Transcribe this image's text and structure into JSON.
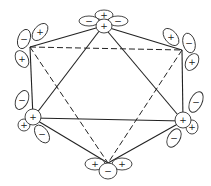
{
  "diagram": {
    "title": "",
    "vertices": [
      {
        "id": "top",
        "x": 103,
        "y": 26
      },
      {
        "id": "upper-left",
        "x": 30,
        "y": 47
      },
      {
        "id": "upper-right",
        "x": 182,
        "y": 50
      },
      {
        "id": "lower-left",
        "x": 33,
        "y": 118
      },
      {
        "id": "lower-right",
        "x": 183,
        "y": 121
      },
      {
        "id": "bottom",
        "x": 108,
        "y": 163
      }
    ],
    "solid_edges": [
      [
        "top",
        "upper-left"
      ],
      [
        "top",
        "upper-right"
      ],
      [
        "top",
        "lower-left"
      ],
      [
        "top",
        "lower-right"
      ],
      [
        "upper-left",
        "lower-left"
      ],
      [
        "upper-right",
        "lower-right"
      ],
      [
        "lower-left",
        "lower-right"
      ],
      [
        "lower-left",
        "bottom"
      ],
      [
        "lower-right",
        "bottom"
      ]
    ],
    "dashed_edges": [
      [
        "upper-left",
        "upper-right"
      ],
      [
        "upper-left",
        "bottom"
      ],
      [
        "upper-right",
        "bottom"
      ]
    ],
    "lobes": [
      {
        "vertex": "top",
        "cx": 104,
        "cy": 15,
        "rx": 9,
        "ry": 5,
        "rot": 0,
        "sign": "+"
      },
      {
        "vertex": "top",
        "cx": 89,
        "cy": 21,
        "rx": 10,
        "ry": 5,
        "rot": 0,
        "sign": "−"
      },
      {
        "vertex": "top",
        "cx": 118,
        "cy": 21,
        "rx": 10,
        "ry": 5,
        "rot": 0,
        "sign": "−"
      },
      {
        "vertex": "top",
        "cx": 104,
        "cy": 26,
        "rx": 8,
        "ry": 7,
        "rot": 0,
        "sign": "+"
      },
      {
        "vertex": "upper-left",
        "cx": 24,
        "cy": 39,
        "rx": 6,
        "ry": 10,
        "rot": 20,
        "sign": "−"
      },
      {
        "vertex": "upper-left",
        "cx": 40,
        "cy": 32,
        "rx": 6,
        "ry": 10,
        "rot": 40,
        "sign": "+"
      },
      {
        "vertex": "upper-left",
        "cx": 22,
        "cy": 59,
        "rx": 6,
        "ry": 9,
        "rot": -30,
        "sign": "+"
      },
      {
        "vertex": "upper-right",
        "cx": 171,
        "cy": 37,
        "rx": 6,
        "ry": 10,
        "rot": -40,
        "sign": "+"
      },
      {
        "vertex": "upper-right",
        "cx": 189,
        "cy": 43,
        "rx": 6,
        "ry": 10,
        "rot": -15,
        "sign": "−"
      },
      {
        "vertex": "upper-right",
        "cx": 192,
        "cy": 62,
        "rx": 6,
        "ry": 9,
        "rot": 30,
        "sign": "+"
      },
      {
        "vertex": "lower-left",
        "cx": 22,
        "cy": 100,
        "rx": 6,
        "ry": 10,
        "rot": 25,
        "sign": "−"
      },
      {
        "vertex": "lower-left",
        "cx": 24,
        "cy": 125,
        "rx": 6,
        "ry": 6,
        "rot": 0,
        "sign": "+"
      },
      {
        "vertex": "lower-left",
        "cx": 42,
        "cy": 134,
        "rx": 6,
        "ry": 10,
        "rot": -35,
        "sign": "−"
      },
      {
        "vertex": "lower-left",
        "cx": 33,
        "cy": 117,
        "rx": 8,
        "ry": 8,
        "rot": 0,
        "sign": "+"
      },
      {
        "vertex": "lower-right",
        "cx": 196,
        "cy": 102,
        "rx": 6,
        "ry": 11,
        "rot": 25,
        "sign": "−"
      },
      {
        "vertex": "lower-right",
        "cx": 192,
        "cy": 127,
        "rx": 6,
        "ry": 7,
        "rot": 0,
        "sign": "+"
      },
      {
        "vertex": "lower-right",
        "cx": 174,
        "cy": 138,
        "rx": 6,
        "ry": 10,
        "rot": 30,
        "sign": "−"
      },
      {
        "vertex": "lower-right",
        "cx": 183,
        "cy": 120,
        "rx": 8,
        "ry": 8,
        "rot": 0,
        "sign": "+"
      },
      {
        "vertex": "bottom",
        "cx": 95,
        "cy": 164,
        "rx": 10,
        "ry": 6,
        "rot": 0,
        "sign": "+"
      },
      {
        "vertex": "bottom",
        "cx": 122,
        "cy": 164,
        "rx": 10,
        "ry": 6,
        "rot": 0,
        "sign": "+"
      },
      {
        "vertex": "bottom",
        "cx": 108,
        "cy": 171,
        "rx": 9,
        "ry": 8,
        "rot": 0,
        "sign": "−"
      }
    ]
  }
}
